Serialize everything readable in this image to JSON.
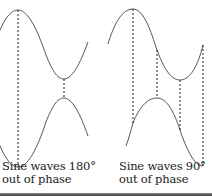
{
  "figure": {
    "left_panel": {
      "caption_line1": "Sine waves 180°",
      "caption_line2": "out of phase",
      "phase_difference_deg": 180
    },
    "right_panel": {
      "caption_line1": "Sine waves 90°",
      "caption_line2": "out of phase",
      "phase_difference_deg": 90
    }
  },
  "colors": {
    "wave": "#555555",
    "guide": "#222222",
    "text": "#1a1a1a",
    "background": "#ffffff"
  }
}
